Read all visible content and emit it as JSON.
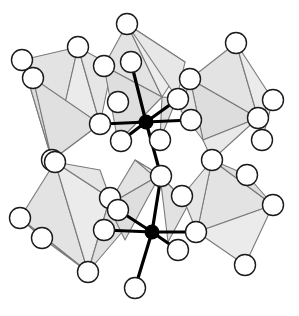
{
  "figure": {
    "width": 299,
    "height": 316,
    "background_color": "#ffffff"
  },
  "style": {
    "polyhedron_fill": "#e3e3e3",
    "polyhedron_fill_light": "#ececec",
    "polyhedron_fill_dark": "#d8d8d8",
    "polyhedron_stroke": "#7a7a7a",
    "polyhedron_stroke_width": 1.1,
    "sphere_fill": "#ffffff",
    "sphere_stroke": "#1a1a1a",
    "sphere_stroke_width": 1.4,
    "sphere_radius": 10.5,
    "cation_fill": "#000000",
    "cation_radius": 7.5,
    "bond_color": "#000000",
    "bond_width": 3.2
  },
  "legend": {
    "anion_label": "anion (open sphere)",
    "cation_label": "cation (filled sphere)",
    "polyhedron_label": "coordination polyhedron"
  },
  "polyhedra": [
    {
      "name": "octahedron-top-left",
      "faces": [
        {
          "points": "78,47 22,60 52,160",
          "fill": "#e3e3e3"
        },
        {
          "points": "78,47 52,160 100,124",
          "fill": "#ebebeb"
        },
        {
          "points": "22,60 33,78 52,160",
          "fill": "#dcdcdc"
        },
        {
          "points": "78,47 100,124 112,66",
          "fill": "#e6e6e6"
        },
        {
          "points": "33,78 52,160 100,124",
          "fill": "#e0e0e0"
        }
      ]
    },
    {
      "name": "octahedron-top-center",
      "faces": [
        {
          "points": "127,24 104,66 162,97",
          "fill": "#e3e3e3"
        },
        {
          "points": "127,24 162,97 185,62",
          "fill": "#ececec"
        },
        {
          "points": "104,66 162,97 118,142",
          "fill": "#dedede"
        },
        {
          "points": "127,24 185,62 177,98",
          "fill": "#e7e7e7"
        },
        {
          "points": "162,97 177,98 160,140",
          "fill": "#e0e0e0"
        }
      ]
    },
    {
      "name": "octahedron-top-right",
      "faces": [
        {
          "points": "236,43 190,79 258,118",
          "fill": "#e3e3e3"
        },
        {
          "points": "236,43 258,118 273,100",
          "fill": "#ebebeb"
        },
        {
          "points": "190,79 258,118 203,140",
          "fill": "#dddddd"
        },
        {
          "points": "190,79 203,140 181,111",
          "fill": "#e6e6e6"
        },
        {
          "points": "258,118 273,100 262,140",
          "fill": "#e2e2e2"
        },
        {
          "points": "203,140 258,118 212,160",
          "fill": "#e9e9e9"
        }
      ]
    },
    {
      "name": "octahedron-bottom-left",
      "faces": [
        {
          "points": "55,162 20,218 88,272",
          "fill": "#e3e3e3"
        },
        {
          "points": "55,162 88,272 110,198",
          "fill": "#ebebeb"
        },
        {
          "points": "20,218 42,238 88,272",
          "fill": "#dbdbdb"
        },
        {
          "points": "55,162 110,198 100,170",
          "fill": "#e6e6e6"
        },
        {
          "points": "88,272 110,198 128,225",
          "fill": "#e0e0e0"
        }
      ]
    },
    {
      "name": "octahedron-bottom-center",
      "faces": [
        {
          "points": "135,160 108,205 160,175",
          "fill": "#e3e3e3"
        },
        {
          "points": "135,160 160,175 188,205",
          "fill": "#ececec"
        },
        {
          "points": "108,205 160,175 125,240",
          "fill": "#dedede"
        },
        {
          "points": "160,175 188,205 168,242",
          "fill": "#e2e2e2"
        }
      ]
    },
    {
      "name": "octahedron-bottom-right",
      "faces": [
        {
          "points": "197,232 212,160 273,205",
          "fill": "#e3e3e3"
        },
        {
          "points": "197,232 273,205 245,265",
          "fill": "#ebebeb"
        },
        {
          "points": "212,160 273,205 247,175",
          "fill": "#dddddd"
        },
        {
          "points": "197,232 212,160 182,196",
          "fill": "#e6e6e6"
        }
      ]
    }
  ],
  "cations": [
    {
      "name": "cation-upper",
      "cx": 146,
      "cy": 122,
      "r": 7.5
    },
    {
      "name": "cation-lower",
      "cx": 152,
      "cy": 232,
      "r": 7.5
    }
  ],
  "bonds": [
    {
      "name": "bond-upper-1",
      "x1": 146,
      "y1": 122,
      "x2": 131,
      "y2": 62
    },
    {
      "name": "bond-upper-2",
      "x1": 146,
      "y1": 122,
      "x2": 178,
      "y2": 99
    },
    {
      "name": "bond-upper-3",
      "x1": 146,
      "y1": 122,
      "x2": 191,
      "y2": 120
    },
    {
      "name": "bond-upper-4",
      "x1": 146,
      "y1": 122,
      "x2": 103,
      "y2": 124
    },
    {
      "name": "bond-upper-5",
      "x1": 146,
      "y1": 122,
      "x2": 121,
      "y2": 141
    },
    {
      "name": "bond-upper-6",
      "x1": 146,
      "y1": 122,
      "x2": 161,
      "y2": 176
    },
    {
      "name": "bond-lower-1",
      "x1": 152,
      "y1": 232,
      "x2": 161,
      "y2": 176
    },
    {
      "name": "bond-lower-2",
      "x1": 152,
      "y1": 232,
      "x2": 118,
      "y2": 210
    },
    {
      "name": "bond-lower-3",
      "x1": 152,
      "y1": 232,
      "x2": 104,
      "y2": 230
    },
    {
      "name": "bond-lower-4",
      "x1": 152,
      "y1": 232,
      "x2": 196,
      "y2": 232
    },
    {
      "name": "bond-lower-5",
      "x1": 152,
      "y1": 232,
      "x2": 178,
      "y2": 250
    },
    {
      "name": "bond-lower-6",
      "x1": 152,
      "y1": 232,
      "x2": 135,
      "y2": 288
    }
  ],
  "anions": [
    {
      "name": "anion-01",
      "cx": 78,
      "cy": 47
    },
    {
      "name": "anion-02",
      "cx": 22,
      "cy": 60
    },
    {
      "name": "anion-03",
      "cx": 33,
      "cy": 78
    },
    {
      "name": "anion-04",
      "cx": 52,
      "cy": 160
    },
    {
      "name": "anion-05",
      "cx": 100,
      "cy": 124
    },
    {
      "name": "anion-06",
      "cx": 127,
      "cy": 24
    },
    {
      "name": "anion-07",
      "cx": 131,
      "cy": 62
    },
    {
      "name": "anion-08",
      "cx": 104,
      "cy": 66
    },
    {
      "name": "anion-09",
      "cx": 118,
      "cy": 102
    },
    {
      "name": "anion-10",
      "cx": 178,
      "cy": 99
    },
    {
      "name": "anion-11",
      "cx": 191,
      "cy": 120
    },
    {
      "name": "anion-12",
      "cx": 236,
      "cy": 43
    },
    {
      "name": "anion-13",
      "cx": 190,
      "cy": 79
    },
    {
      "name": "anion-14",
      "cx": 273,
      "cy": 100
    },
    {
      "name": "anion-15",
      "cx": 258,
      "cy": 118
    },
    {
      "name": "anion-16",
      "cx": 121,
      "cy": 141
    },
    {
      "name": "anion-17",
      "cx": 161,
      "cy": 176
    },
    {
      "name": "anion-18",
      "cx": 212,
      "cy": 160
    },
    {
      "name": "anion-19",
      "cx": 55,
      "cy": 162
    },
    {
      "name": "anion-20",
      "cx": 20,
      "cy": 218
    },
    {
      "name": "anion-21",
      "cx": 42,
      "cy": 238
    },
    {
      "name": "anion-22",
      "cx": 88,
      "cy": 272
    },
    {
      "name": "anion-23",
      "cx": 110,
      "cy": 198
    },
    {
      "name": "anion-24",
      "cx": 118,
      "cy": 210
    },
    {
      "name": "anion-25",
      "cx": 104,
      "cy": 230
    },
    {
      "name": "anion-26",
      "cx": 196,
      "cy": 232
    },
    {
      "name": "anion-27",
      "cx": 178,
      "cy": 250
    },
    {
      "name": "anion-28",
      "cx": 135,
      "cy": 288
    },
    {
      "name": "anion-29",
      "cx": 273,
      "cy": 205
    },
    {
      "name": "anion-30",
      "cx": 245,
      "cy": 265
    },
    {
      "name": "anion-31",
      "cx": 247,
      "cy": 175
    },
    {
      "name": "anion-32",
      "cx": 182,
      "cy": 196
    },
    {
      "name": "anion-33",
      "cx": 160,
      "cy": 140
    },
    {
      "name": "anion-34",
      "cx": 262,
      "cy": 140
    }
  ]
}
